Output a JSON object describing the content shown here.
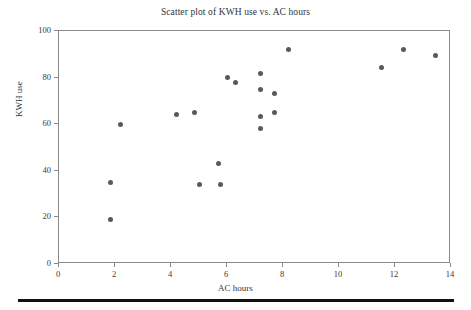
{
  "chart_data": {
    "type": "scatter",
    "title": "Scatter plot of KWH use vs. AC hours",
    "xlabel": "AC hours",
    "ylabel": "KWH use",
    "xlim": [
      0,
      14
    ],
    "ylim": [
      0,
      100
    ],
    "xticks": [
      0,
      2,
      4,
      6,
      8,
      10,
      12,
      14
    ],
    "yticks": [
      0,
      20,
      40,
      60,
      80,
      100
    ],
    "grid": false,
    "legend": null,
    "marker_color": "#555a5f",
    "points": [
      {
        "x": 1.85,
        "y": 19.3
      },
      {
        "x": 1.85,
        "y": 35.0
      },
      {
        "x": 2.2,
        "y": 60.0
      },
      {
        "x": 4.2,
        "y": 64.0
      },
      {
        "x": 5.0,
        "y": 34.0
      },
      {
        "x": 4.85,
        "y": 65.0
      },
      {
        "x": 5.75,
        "y": 34.0
      },
      {
        "x": 5.7,
        "y": 43.0
      },
      {
        "x": 6.0,
        "y": 80.0
      },
      {
        "x": 6.3,
        "y": 78.0
      },
      {
        "x": 7.2,
        "y": 58.0
      },
      {
        "x": 7.2,
        "y": 63.2
      },
      {
        "x": 7.2,
        "y": 75.0
      },
      {
        "x": 7.2,
        "y": 81.8
      },
      {
        "x": 7.7,
        "y": 65.0
      },
      {
        "x": 7.7,
        "y": 73.0
      },
      {
        "x": 8.2,
        "y": 92.0
      },
      {
        "x": 11.5,
        "y": 84.5
      },
      {
        "x": 12.3,
        "y": 92.0
      },
      {
        "x": 13.45,
        "y": 89.5
      }
    ]
  },
  "figure": {
    "background": "#ffffff",
    "axis_color": "#8a8a8a",
    "rule_color": "#111111"
  }
}
